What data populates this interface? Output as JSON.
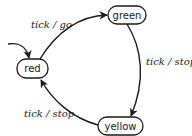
{
  "diagram": {
    "type": "state-machine",
    "initial_state": "red",
    "states": [
      {
        "id": "red",
        "label": "red"
      },
      {
        "id": "green",
        "label": "green"
      },
      {
        "id": "yellow",
        "label": "yellow"
      }
    ],
    "transitions": [
      {
        "from": "red",
        "to": "green",
        "label": "tick / go"
      },
      {
        "from": "green",
        "to": "yellow",
        "label": "tick / stop"
      },
      {
        "from": "yellow",
        "to": "red",
        "label": "tick / stop"
      }
    ],
    "colors": {
      "stroke": "#1a1a1a",
      "background": "#ffffff"
    }
  }
}
